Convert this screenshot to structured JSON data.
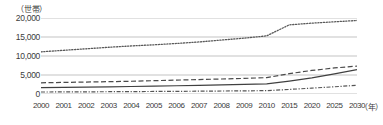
{
  "chart_data": {
    "type": "line",
    "title": "",
    "subtitle": "",
    "xlabel": "（年）",
    "ylabel": "（世帯）",
    "ylim": [
      0,
      20000
    ],
    "yticks": [
      0,
      5000,
      10000,
      15000,
      20000
    ],
    "ytick_labels": [
      "0",
      "5,000",
      "10,000",
      "15,000",
      "20,000"
    ],
    "grid": true,
    "legend_position": "none",
    "categories": [
      "2000",
      "2001",
      "2002",
      "2003",
      "2004",
      "2005",
      "2006",
      "2007",
      "2008",
      "2009",
      "2010",
      "2015",
      "2020",
      "2025",
      "2030"
    ],
    "x": [
      2000,
      2001,
      2002,
      2003,
      2004,
      2005,
      2006,
      2007,
      2008,
      2009,
      2010,
      2015,
      2020,
      2025,
      2030
    ],
    "series": [
      {
        "name": "series-dotted",
        "style": "dotted",
        "color": "#595959",
        "values": [
          11100,
          11500,
          11900,
          12300,
          12650,
          12950,
          13300,
          13700,
          14200,
          14700,
          15300,
          18200,
          18650,
          19000,
          19350
        ]
      },
      {
        "name": "series-dashed",
        "style": "dashed",
        "color": "#4a4a4a",
        "values": [
          2950,
          3050,
          3150,
          3250,
          3350,
          3500,
          3650,
          3800,
          3950,
          4100,
          4300,
          5350,
          6200,
          6850,
          7350
        ]
      },
      {
        "name": "series-solid",
        "style": "solid",
        "color": "#404040",
        "values": [
          1700,
          1760,
          1830,
          1900,
          1980,
          2070,
          2170,
          2280,
          2400,
          2530,
          2680,
          3400,
          4250,
          5300,
          6400
        ]
      },
      {
        "name": "series-dashdot",
        "style": "dashdot",
        "color": "#555555",
        "values": [
          520,
          545,
          570,
          600,
          630,
          665,
          700,
          740,
          785,
          830,
          880,
          1200,
          1550,
          1900,
          2300
        ]
      }
    ]
  },
  "axis": {
    "unit_label": "（世帯）",
    "x_unit_label": "（年）"
  }
}
